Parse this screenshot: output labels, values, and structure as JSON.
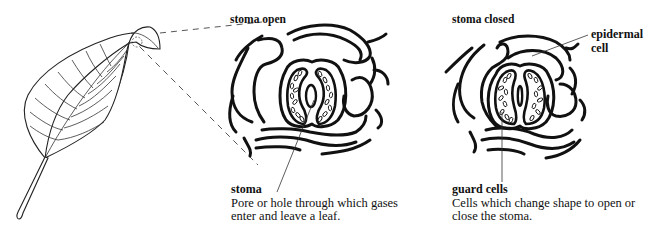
{
  "figure": {
    "panels": [
      {
        "id": "open",
        "title": "stoma open",
        "term": "stoma",
        "description": "Pore or hole through which gases enter and leave a leaf."
      },
      {
        "id": "closed",
        "title": "stoma closed",
        "term": "guard cells",
        "description": "Cells which change shape to open or close the stoma.",
        "side_label": "epidermal cell"
      }
    ],
    "leaf": {
      "name": "leaf with folded tip showing magnified area"
    },
    "colors": {
      "ink": "#111111",
      "background": "#ffffff"
    }
  }
}
